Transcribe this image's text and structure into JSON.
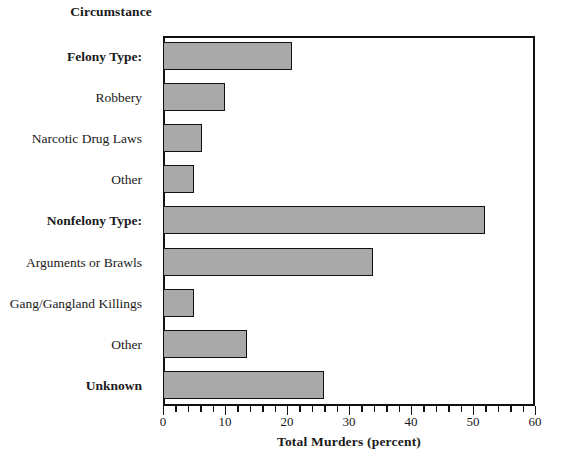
{
  "chart_data": {
    "type": "bar",
    "orientation": "horizontal",
    "title": "",
    "group_header": "Circumstance",
    "xlabel": "Total Murders (percent)",
    "ylabel": "Circumstance",
    "xlim": [
      0,
      60
    ],
    "xticks": [
      0,
      10,
      20,
      30,
      40,
      50,
      60
    ],
    "xtick_labels": [
      "0",
      "10",
      "20",
      "30",
      "40",
      "50",
      "60"
    ],
    "minor_tick_step": 2,
    "grid": false,
    "legend": false,
    "bar_color": "#a9a9a9",
    "bar_edge_color": "#111111",
    "categories": [
      "Felony Type:",
      "Robbery",
      "Narcotic Drug Laws",
      "Other",
      "Nonfelony Type:",
      "Arguments or Brawls",
      "Gang/Gangland Killings",
      "Other",
      "Unknown"
    ],
    "values": [
      20.8,
      10.0,
      6.3,
      5.0,
      52.0,
      33.9,
      5.0,
      13.5,
      26.0
    ],
    "category_styles": [
      "bold",
      "normal",
      "normal",
      "normal",
      "bold",
      "normal",
      "normal",
      "normal",
      "bold"
    ]
  }
}
